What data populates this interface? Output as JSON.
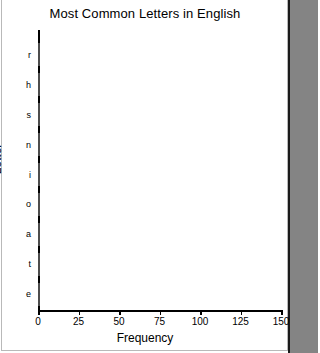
{
  "window": {
    "background_color": "#ffffff",
    "gutter_color": "#848484"
  },
  "chart_data": {
    "type": "bar",
    "orientation": "horizontal",
    "title": "Most Common Letters in English",
    "xlabel": "Frequency",
    "ylabel": "Letter",
    "categories": [
      "r",
      "h",
      "s",
      "n",
      "i",
      "o",
      "a",
      "t",
      "e"
    ],
    "values": [
      60,
      61,
      62,
      65,
      68,
      74,
      81,
      89,
      120
    ],
    "xlim": [
      0,
      150
    ],
    "xticks": [
      0,
      25,
      50,
      75,
      100,
      125,
      150
    ],
    "xtick_labels": [
      "0",
      "25",
      "50",
      "75",
      "100",
      "125",
      "150"
    ],
    "grid": false,
    "legend": null,
    "bar_color": "#a3a3a3",
    "bar_edge_color": "#4d4d4d"
  }
}
